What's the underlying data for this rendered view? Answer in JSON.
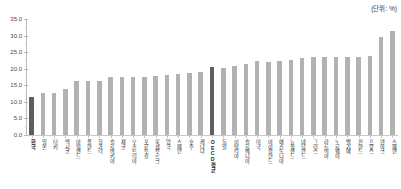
{
  "unit_note": "(단위: %)",
  "chart_data": {
    "type": "bar",
    "title": "",
    "xlabel": "",
    "ylabel": "",
    "ylim": [
      0.0,
      35.0
    ],
    "ytick_labels": [
      "0.0",
      "5.0",
      "10.0",
      "15.0",
      "20.0",
      "25.0",
      "30.0",
      "35.0"
    ],
    "ytick_values": [
      0.0,
      5.0,
      10.0,
      15.0,
      20.0,
      25.0,
      30.0,
      35.0
    ],
    "grid": false,
    "legend": "none",
    "highlight_color": "#5e5e5e",
    "bar_color": "#b2b2b2",
    "categories": [
      "한국",
      "일본",
      "터키",
      "멕시코",
      "아일랜드",
      "폴란드",
      "헝가리",
      "슬로바키아",
      "체코",
      "오스트리아",
      "포르투갈",
      "룩셈부르크",
      "영국",
      "스페인",
      "호주",
      "캐나다",
      "OECD평균",
      "독일",
      "이탈리아",
      "슬로베니아",
      "미국",
      "아이슬란드",
      "에스토니아",
      "뉴질랜드",
      "네덜란드",
      "그리스",
      "라트비아",
      "노르웨이",
      "벨기에",
      "핀란드",
      "프랑스",
      "덴마크",
      "스웨덴"
    ],
    "values": [
      11.5,
      12.6,
      12.7,
      13.8,
      16.4,
      16.2,
      16.4,
      17.6,
      17.6,
      17.6,
      17.6,
      17.8,
      18.2,
      18.3,
      18.6,
      19.1,
      20.4,
      20.3,
      20.8,
      21.5,
      22.2,
      22.0,
      22.4,
      22.6,
      23.3,
      23.4,
      23.4,
      23.5,
      23.5,
      23.5,
      23.9,
      29.5,
      31.5
    ],
    "highlighted_indices": [
      0,
      16
    ]
  }
}
